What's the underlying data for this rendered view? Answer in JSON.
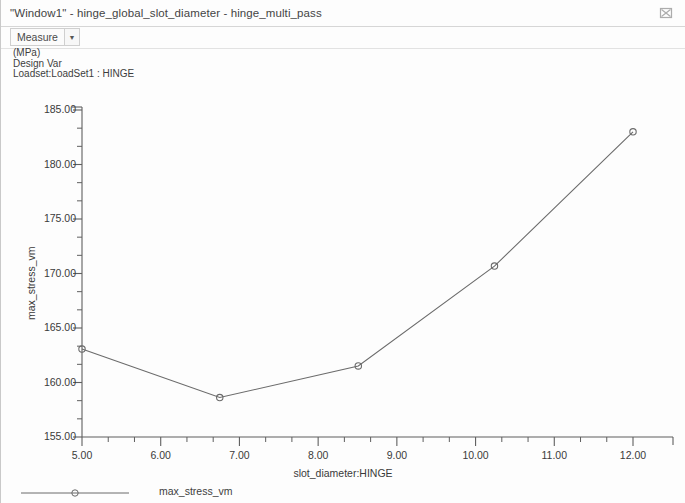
{
  "window": {
    "title": "\"Window1\" - hinge_global_slot_diameter - hinge_multi_pass",
    "close_icon": "close-icon"
  },
  "toolbar": {
    "measure_label": "Measure",
    "dropdown_arrow": "chevron-down-icon"
  },
  "info": {
    "units": "(MPa)",
    "design_var": "Design Var",
    "loadset": "Loadset:LoadSet1 : HINGE"
  },
  "legend": {
    "entries": [
      {
        "label": "max_stress_vm",
        "marker": "circle",
        "color": "#6b6b6b"
      }
    ]
  },
  "chart_data": {
    "type": "line",
    "title": "",
    "xlabel": "slot_diameter:HINGE",
    "ylabel": "max_stress_vm",
    "units": "(MPa)",
    "xlim": [
      4.7,
      12.05
    ],
    "ylim": [
      155.0,
      185.0
    ],
    "xticks": [
      5.0,
      6.0,
      7.0,
      8.0,
      9.0,
      10.0,
      11.0,
      12.0
    ],
    "xtick_labels": [
      "5.00",
      "6.00",
      "7.00",
      "8.00",
      "9.00",
      "10.00",
      "11.00",
      "12.00"
    ],
    "yticks": [
      155.0,
      160.0,
      165.0,
      170.0,
      175.0,
      180.0,
      185.0
    ],
    "ytick_labels": [
      "155.00",
      "160.00",
      "165.00",
      "170.00",
      "175.00",
      "180.00",
      "185.00"
    ],
    "minor_ticks_per_interval": 2,
    "grid": false,
    "legend_position": "bottom-left",
    "line_color": "#6b6b6b",
    "marker": "circle",
    "series": [
      {
        "name": "max_stress_vm",
        "x": [
          5.0,
          6.75,
          8.51,
          10.24,
          12.0
        ],
        "values": [
          163.07,
          158.62,
          161.52,
          170.68,
          183.0
        ]
      }
    ]
  }
}
